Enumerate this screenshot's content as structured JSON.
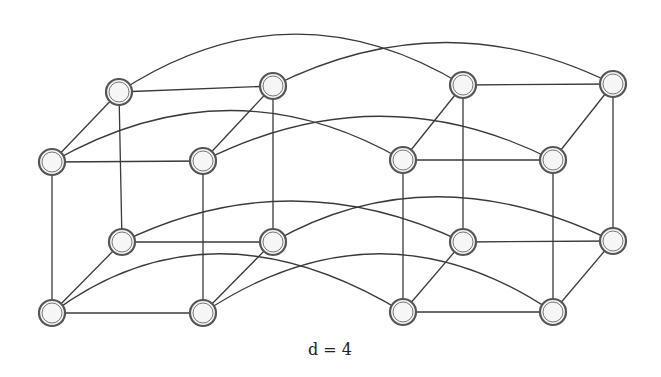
{
  "diagram": {
    "caption": "d = 4",
    "colors": {
      "edge": "#3a3a3a",
      "node_stroke": "#555555",
      "node_fill": "#f4f4f4",
      "background": "#ffffff"
    },
    "node_radius": 13,
    "nodes": [
      {
        "id": "A",
        "x": 119,
        "y": 92
      },
      {
        "id": "B",
        "x": 273,
        "y": 86
      },
      {
        "id": "C",
        "x": 52,
        "y": 162
      },
      {
        "id": "D",
        "x": 203,
        "y": 161
      },
      {
        "id": "E",
        "x": 463,
        "y": 85
      },
      {
        "id": "F",
        "x": 613,
        "y": 84
      },
      {
        "id": "G",
        "x": 403,
        "y": 160
      },
      {
        "id": "H",
        "x": 553,
        "y": 160
      },
      {
        "id": "I",
        "x": 122,
        "y": 242
      },
      {
        "id": "J",
        "x": 273,
        "y": 242
      },
      {
        "id": "K",
        "x": 52,
        "y": 313
      },
      {
        "id": "L",
        "x": 203,
        "y": 313
      },
      {
        "id": "M",
        "x": 463,
        "y": 242
      },
      {
        "id": "N",
        "x": 613,
        "y": 241
      },
      {
        "id": "O",
        "x": 403,
        "y": 312
      },
      {
        "id": "P",
        "x": 553,
        "y": 312
      }
    ],
    "straight_edges": [
      [
        "A",
        "B"
      ],
      [
        "C",
        "D"
      ],
      [
        "A",
        "C"
      ],
      [
        "B",
        "D"
      ],
      [
        "I",
        "J"
      ],
      [
        "K",
        "L"
      ],
      [
        "I",
        "K"
      ],
      [
        "J",
        "L"
      ],
      [
        "A",
        "I"
      ],
      [
        "B",
        "J"
      ],
      [
        "C",
        "K"
      ],
      [
        "D",
        "L"
      ],
      [
        "E",
        "F"
      ],
      [
        "G",
        "H"
      ],
      [
        "E",
        "G"
      ],
      [
        "F",
        "H"
      ],
      [
        "M",
        "N"
      ],
      [
        "O",
        "P"
      ],
      [
        "M",
        "O"
      ],
      [
        "N",
        "P"
      ],
      [
        "E",
        "M"
      ],
      [
        "F",
        "N"
      ],
      [
        "G",
        "O"
      ],
      [
        "H",
        "P"
      ]
    ],
    "curved_edges": [
      {
        "from": "A",
        "to": "E",
        "cx": 290,
        "cy": -20
      },
      {
        "from": "B",
        "to": "F",
        "cx": 445,
        "cy": 0
      },
      {
        "from": "C",
        "to": "G",
        "cx": 230,
        "cy": 60
      },
      {
        "from": "D",
        "to": "H",
        "cx": 380,
        "cy": 72
      },
      {
        "from": "I",
        "to": "M",
        "cx": 290,
        "cy": 160
      },
      {
        "from": "J",
        "to": "N",
        "cx": 430,
        "cy": 152
      },
      {
        "from": "K",
        "to": "O",
        "cx": 210,
        "cy": 195
      },
      {
        "from": "L",
        "to": "P",
        "cx": 380,
        "cy": 195
      }
    ]
  }
}
